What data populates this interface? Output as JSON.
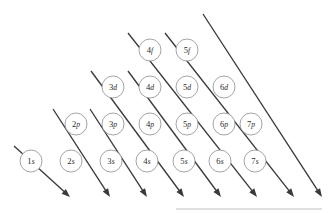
{
  "figure": {
    "background_color": "#ffffff",
    "circle_stroke_color": "#9a9a9a",
    "arrow_color": "#3a3a3a",
    "label_color": "#2b2b2b",
    "baseline_color": "#b9b9b9"
  },
  "geometry": {
    "width": 332,
    "height": 213,
    "column_spacing": 37,
    "row_spacing": 37,
    "circle_radius": 11,
    "origin_x": 29,
    "origin_y": 161
  },
  "chart_data": {
    "type": "diagram",
    "rows": [
      {
        "shell_type": "f",
        "row_index": 3,
        "orbitals": [
          {
            "label": "4f",
            "n": "4",
            "subshell": "f",
            "col": 3,
            "cx": 150,
            "cy": 50
          },
          {
            "label": "5f",
            "n": "5",
            "subshell": "f",
            "col": 4,
            "cx": 187,
            "cy": 50
          }
        ]
      },
      {
        "shell_type": "d",
        "row_index": 2,
        "orbitals": [
          {
            "label": "3d",
            "n": "3",
            "subshell": "d",
            "col": 2,
            "cx": 113,
            "cy": 87
          },
          {
            "label": "4d",
            "n": "4",
            "subshell": "d",
            "col": 3,
            "cx": 150,
            "cy": 87
          },
          {
            "label": "5d",
            "n": "5",
            "subshell": "d",
            "col": 4,
            "cx": 187,
            "cy": 87
          },
          {
            "label": "6d",
            "n": "6",
            "subshell": "d",
            "col": 5,
            "cx": 224,
            "cy": 87
          }
        ]
      },
      {
        "shell_type": "p",
        "row_index": 1,
        "orbitals": [
          {
            "label": "2p",
            "n": "2",
            "subshell": "p",
            "col": 1,
            "cx": 76,
            "cy": 124
          },
          {
            "label": "3p",
            "n": "3",
            "subshell": "p",
            "col": 2,
            "cx": 113,
            "cy": 124
          },
          {
            "label": "4p",
            "n": "4",
            "subshell": "p",
            "col": 3,
            "cx": 150,
            "cy": 124
          },
          {
            "label": "5p",
            "n": "5",
            "subshell": "p",
            "col": 4,
            "cx": 187,
            "cy": 124
          },
          {
            "label": "6p",
            "n": "6",
            "subshell": "p",
            "col": 5,
            "cx": 224,
            "cy": 124
          },
          {
            "label": "7p",
            "n": "7",
            "subshell": "p",
            "col": 6,
            "cx": 251,
            "cy": 124
          }
        ]
      },
      {
        "shell_type": "s",
        "row_index": 0,
        "orbitals": [
          {
            "label": "1s",
            "n": "1",
            "subshell": "s",
            "col": 0,
            "cx": 31,
            "cy": 161
          },
          {
            "label": "2s",
            "n": "2",
            "subshell": "s",
            "col": 1,
            "cx": 71,
            "cy": 161
          },
          {
            "label": "3s",
            "n": "3",
            "subshell": "s",
            "col": 2,
            "cx": 111,
            "cy": 161
          },
          {
            "label": "4s",
            "n": "4",
            "subshell": "s",
            "col": 3,
            "cx": 147,
            "cy": 161
          },
          {
            "label": "5s",
            "n": "5",
            "subshell": "s",
            "col": 4,
            "cx": 184,
            "cy": 161
          },
          {
            "label": "6s",
            "n": "6",
            "subshell": "s",
            "col": 5,
            "cx": 220,
            "cy": 161
          },
          {
            "label": "7s",
            "n": "7",
            "subshell": "s",
            "col": 6,
            "cx": 255,
            "cy": 161
          }
        ]
      }
    ],
    "arrows": [
      {
        "name": "arrow-1s",
        "x1": 14,
        "y1": 146,
        "x2": 70,
        "y2": 197
      },
      {
        "name": "arrow-2s-2p",
        "x1": 53,
        "y1": 109,
        "x2": 110,
        "y2": 197
      },
      {
        "name": "arrow-3s-3p",
        "x1": 90,
        "y1": 109,
        "x2": 147,
        "y2": 197
      },
      {
        "name": "arrow-4s-3d-4p",
        "x1": 91,
        "y1": 71,
        "x2": 184,
        "y2": 197
      },
      {
        "name": "arrow-5s-4d-5p",
        "x1": 128,
        "y1": 71,
        "x2": 221,
        "y2": 197
      },
      {
        "name": "arrow-6s-5d-4f-6p",
        "x1": 128,
        "y1": 33,
        "x2": 257,
        "y2": 197
      },
      {
        "name": "arrow-7s-6d-5f-7p",
        "x1": 165,
        "y1": 33,
        "x2": 294,
        "y2": 197
      },
      {
        "name": "arrow-8s-tail",
        "x1": 203,
        "y1": 14,
        "x2": 322,
        "y2": 197
      }
    ],
    "baseline": {
      "x1": 176,
      "y1": 209,
      "x2": 322,
      "y2": 209
    }
  }
}
